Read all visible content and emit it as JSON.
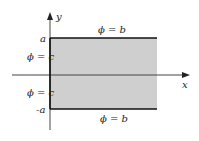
{
  "diagram": {
    "axes": {
      "x_label": "x",
      "y_label": "y"
    },
    "ticks": {
      "top": "a",
      "bottom": "-a"
    },
    "boundaries": {
      "top": "ϕ = b",
      "bottom": "ϕ = b",
      "left_upper": "ϕ = c",
      "left_lower": "ϕ = c"
    },
    "colors": {
      "region_fill": "#cfcfcf",
      "line": "#111111",
      "axis": "#444444"
    }
  }
}
